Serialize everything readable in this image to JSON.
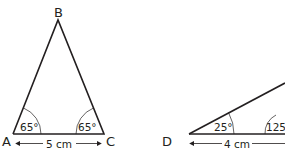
{
  "triangle_abc": {
    "vertices": {
      "A": "A",
      "B": "B",
      "C": "C"
    },
    "angle_a": "65°",
    "angle_c": "65°",
    "base_length": "5 cm"
  },
  "triangle_d": {
    "vertices": {
      "D": "D"
    },
    "angle_d": "25°",
    "angle_other": "125°",
    "base_length": "4 cm"
  },
  "colors": {
    "stroke": "#231f20",
    "background": "#ffffff"
  }
}
